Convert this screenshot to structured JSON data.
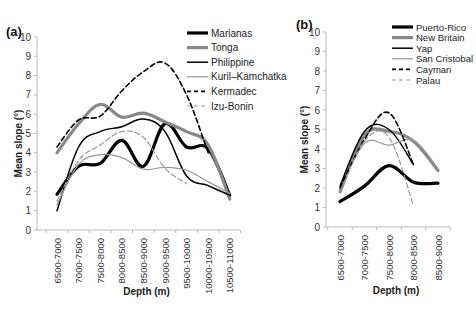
{
  "chart_data": [
    {
      "panel_label": "(a)",
      "type": "line",
      "title": "",
      "xlabel": "Depth (m)",
      "ylabel": "Mean slope (°)",
      "ylim": [
        0,
        10
      ],
      "yticks": [
        0,
        1,
        2,
        3,
        4,
        5,
        6,
        7,
        8,
        9,
        10
      ],
      "grid": false,
      "legend_position": "upper right",
      "categories": [
        "6500-7000",
        "7000-7500",
        "7500-8000",
        "8000-8500",
        "8500-9000",
        "9000-9500",
        "9500-10000",
        "10000-10500",
        "10500-11000"
      ],
      "series": [
        {
          "name": "Marianas",
          "style": "solid-thick",
          "color": "#000000",
          "values": [
            1.85,
            3.3,
            3.45,
            4.65,
            3.3,
            5.5,
            4.3,
            4.2,
            1.8
          ]
        },
        {
          "name": "Tonga",
          "style": "solid-thick",
          "color": "#888888",
          "values": [
            4.0,
            5.5,
            6.5,
            5.85,
            6.05,
            5.6,
            5.1,
            4.4,
            1.6
          ]
        },
        {
          "name": "Philippine",
          "style": "solid",
          "color": "#000000",
          "values": [
            1.0,
            4.3,
            5.1,
            5.35,
            5.75,
            5.1,
            2.8,
            2.3,
            1.8
          ]
        },
        {
          "name": "Kuril–Kamchatka",
          "style": "solid-thin",
          "color": "#999999",
          "values": [
            1.3,
            3.4,
            3.9,
            3.75,
            3.15,
            3.25,
            3.1,
            2.5,
            1.9
          ]
        },
        {
          "name": "Kermadec",
          "style": "dashed",
          "color": "#000000",
          "values": [
            4.3,
            5.7,
            5.9,
            7.2,
            8.2,
            8.65,
            7.0,
            4.0,
            null
          ]
        },
        {
          "name": "Izu-Bonin",
          "style": "dashed-thin",
          "color": "#999999",
          "values": [
            1.5,
            3.6,
            4.4,
            5.1,
            4.8,
            3.2,
            2.4,
            null,
            null
          ]
        }
      ]
    },
    {
      "panel_label": "(b)",
      "type": "line",
      "title": "",
      "xlabel": "Depth (m)",
      "ylabel": "Mean slope (°)",
      "ylim": [
        0,
        10
      ],
      "yticks": [
        0,
        1,
        2,
        3,
        4,
        5,
        6,
        7,
        8,
        9,
        10
      ],
      "grid": false,
      "legend_position": "upper right",
      "categories": [
        "6500-7000",
        "7000-7500",
        "7500-8000",
        "8000-8500",
        "8500-9000"
      ],
      "series": [
        {
          "name": "Puerto-Rico",
          "style": "solid-thick",
          "color": "#000000",
          "values": [
            1.3,
            2.1,
            3.15,
            2.3,
            2.25
          ]
        },
        {
          "name": "New Britain",
          "style": "solid-thick",
          "color": "#888888",
          "values": [
            1.8,
            4.7,
            4.9,
            4.4,
            2.9
          ]
        },
        {
          "name": "Yap",
          "style": "solid",
          "color": "#000000",
          "values": [
            2.1,
            4.9,
            5.0,
            3.2,
            null
          ]
        },
        {
          "name": "San Cristobal",
          "style": "solid-thin",
          "color": "#999999",
          "values": [
            1.9,
            4.3,
            4.2,
            4.45,
            3.0
          ]
        },
        {
          "name": "Cayman",
          "style": "dashed",
          "color": "#000000",
          "values": [
            2.0,
            4.5,
            5.85,
            3.2,
            null
          ]
        },
        {
          "name": "Palau",
          "style": "dashed-thin",
          "color": "#999999",
          "values": [
            1.8,
            4.4,
            4.6,
            1.1,
            null
          ]
        }
      ]
    }
  ]
}
